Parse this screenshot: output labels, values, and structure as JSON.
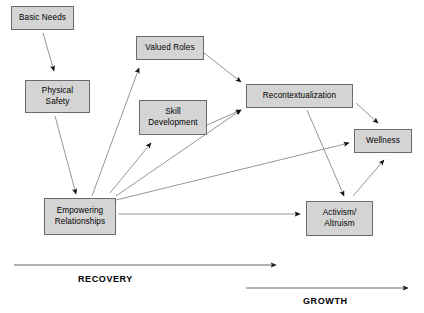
{
  "diagram": {
    "box_fill": "#d4d4d4",
    "box_border": "#6b6b6b",
    "edge_color": "#8a8a8a",
    "timeline_color": "#555555",
    "nodes": [
      {
        "id": "basic-needs",
        "label": "Basic Needs",
        "x": 11,
        "y": 6,
        "w": 63,
        "h": 24
      },
      {
        "id": "physical-safety",
        "label": "Physical\nSafety",
        "x": 25,
        "y": 80,
        "w": 65,
        "h": 33
      },
      {
        "id": "valued-roles",
        "label": "Valued Roles",
        "x": 136,
        "y": 36,
        "w": 68,
        "h": 24
      },
      {
        "id": "skill-development",
        "label": "Skill\nDevelopment",
        "x": 139,
        "y": 100,
        "w": 68,
        "h": 35
      },
      {
        "id": "recontextualization",
        "label": "Recontextualization",
        "x": 246,
        "y": 84,
        "w": 107,
        "h": 24
      },
      {
        "id": "wellness",
        "label": "Wellness",
        "x": 354,
        "y": 129,
        "w": 58,
        "h": 24
      },
      {
        "id": "empowering-relationships",
        "label": "Empowering\nRelationships",
        "x": 44,
        "y": 198,
        "w": 72,
        "h": 37
      },
      {
        "id": "activism-altruism",
        "label": "Activism/\nAltruism",
        "x": 306,
        "y": 201,
        "w": 67,
        "h": 35
      }
    ],
    "edges": [
      {
        "id": "basic-needs-to-physical-safety",
        "from": "basic-needs",
        "to": "physical-safety",
        "x1": 43,
        "y1": 33,
        "x2": 54,
        "y2": 71
      },
      {
        "id": "physical-safety-to-empowering-relationships",
        "from": "physical-safety",
        "to": "empowering-relationships",
        "x1": 55,
        "y1": 116,
        "x2": 76,
        "y2": 194
      },
      {
        "id": "empowering-relationships-to-valued-roles",
        "from": "empowering-relationships",
        "to": "valued-roles",
        "x1": 92,
        "y1": 196,
        "x2": 139,
        "y2": 68
      },
      {
        "id": "empowering-relationships-to-skill-development",
        "from": "empowering-relationships",
        "to": "skill-development",
        "x1": 110,
        "y1": 193,
        "x2": 151,
        "y2": 143
      },
      {
        "id": "empowering-relationships-to-recontextualization",
        "from": "empowering-relationships",
        "to": "recontextualization",
        "x1": 116,
        "y1": 196,
        "x2": 241,
        "y2": 110
      },
      {
        "id": "empowering-relationships-to-wellness",
        "from": "empowering-relationships",
        "to": "wellness",
        "x1": 116,
        "y1": 200,
        "x2": 349,
        "y2": 143
      },
      {
        "id": "empowering-relationships-to-activism-altruism",
        "from": "empowering-relationships",
        "to": "activism-altruism",
        "x1": 118,
        "y1": 214,
        "x2": 300,
        "y2": 214
      },
      {
        "id": "valued-roles-to-recontextualization",
        "from": "valued-roles",
        "to": "recontextualization",
        "x1": 204,
        "y1": 53,
        "x2": 241,
        "y2": 82
      },
      {
        "id": "skill-development-to-recontextualization",
        "from": "skill-development",
        "to": "recontextualization",
        "x1": 207,
        "y1": 125,
        "x2": 241,
        "y2": 110
      },
      {
        "id": "recontextualization-to-wellness",
        "from": "recontextualization",
        "to": "wellness",
        "x1": 356,
        "y1": 103,
        "x2": 378,
        "y2": 123
      },
      {
        "id": "recontextualization-to-activism-altruism",
        "from": "recontextualization",
        "to": "activism-altruism",
        "x1": 307,
        "y1": 110,
        "x2": 344,
        "y2": 196
      },
      {
        "id": "activism-altruism-to-wellness",
        "from": "activism-altruism",
        "to": "wellness",
        "x1": 353,
        "y1": 196,
        "x2": 384,
        "y2": 160
      }
    ],
    "timelines": [
      {
        "id": "recovery",
        "label": "RECOVERY",
        "x1": 14,
        "y1": 265,
        "x2": 276,
        "label_x": 78,
        "label_y": 274
      },
      {
        "id": "growth",
        "label": "GROWTH",
        "x1": 246,
        "y1": 288,
        "x2": 408,
        "label_x": 303,
        "label_y": 296
      }
    ]
  }
}
